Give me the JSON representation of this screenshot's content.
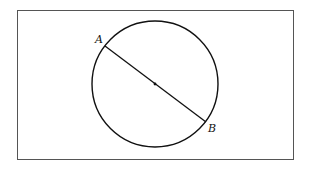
{
  "diagram": {
    "type": "geometry",
    "frame": {
      "x": 17,
      "y": 10,
      "width": 276,
      "height": 149,
      "stroke": "#555555"
    },
    "circle": {
      "cx": 155,
      "cy": 84,
      "r": 63,
      "stroke": "#111111"
    },
    "center_point": {
      "x": 155,
      "y": 84
    },
    "segment": {
      "from": "A",
      "to": "B",
      "description": "diameter through center"
    },
    "points": [
      {
        "label": "A",
        "x": 105,
        "y": 46,
        "label_x": 95,
        "label_y": 43
      },
      {
        "label": "B",
        "x": 206,
        "y": 122,
        "label_x": 208,
        "label_y": 132
      }
    ]
  }
}
